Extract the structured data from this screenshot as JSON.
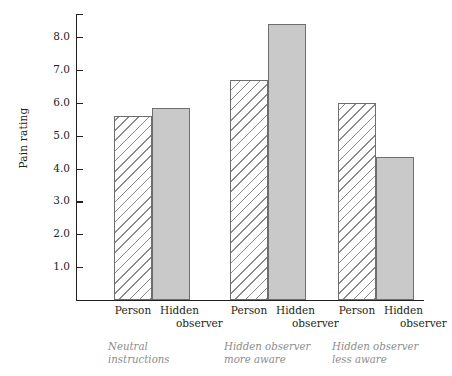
{
  "chart_data": {
    "type": "bar",
    "title": "",
    "subtitle": "",
    "xlabel": "",
    "ylabel": "Pain rating",
    "ylim": [
      0,
      8.7
    ],
    "ytick_values": [
      1.0,
      2.0,
      3.0,
      4.0,
      5.0,
      6.0,
      7.0,
      8.0
    ],
    "ytick_labels": [
      "1.0",
      "2.0",
      "3.0",
      "4.0",
      "5.0",
      "6.0",
      "7.0",
      "8.0"
    ],
    "grid": false,
    "legend": "none",
    "legend_position": "none",
    "categories": [
      "Person",
      "Hidden observer"
    ],
    "groups": [
      {
        "note": "Neutral instructions",
        "note_line1": "Neutral",
        "note_line2": "instructions",
        "bars": [
          {
            "category": "Person",
            "category_line1": "Person",
            "category_line2": "",
            "value": 5.6,
            "style": "hatched"
          },
          {
            "category": "Hidden observer",
            "category_line1": "Hidden",
            "category_line2": "observer",
            "value": 5.85,
            "style": "solid"
          }
        ]
      },
      {
        "note": "Hidden observer more aware",
        "note_line1": "Hidden observer",
        "note_line2": "more aware",
        "bars": [
          {
            "category": "Person",
            "category_line1": "Person",
            "category_line2": "",
            "value": 6.7,
            "style": "hatched"
          },
          {
            "category": "Hidden observer",
            "category_line1": "Hidden",
            "category_line2": "observer",
            "value": 8.4,
            "style": "solid"
          }
        ]
      },
      {
        "note": "Hidden observer less aware",
        "note_line1": "Hidden observer",
        "note_line2": "less aware",
        "bars": [
          {
            "category": "Person",
            "category_line1": "Person",
            "category_line2": "",
            "value": 6.0,
            "style": "hatched"
          },
          {
            "category": "Hidden observer",
            "category_line1": "Hidden",
            "category_line2": "observer",
            "value": 4.35,
            "style": "solid"
          }
        ]
      }
    ],
    "colors": {
      "axis": "#231f20",
      "hatch_line": "#8a8a8a",
      "solid_fill": "#c9c9c9",
      "bar_border": "#6e6e6e",
      "note_text": "#8d8d8d",
      "background": "#ffffff"
    }
  }
}
